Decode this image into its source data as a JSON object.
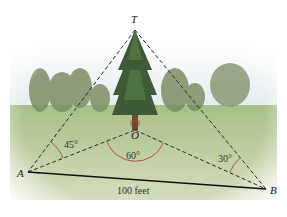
{
  "diagram": {
    "points": {
      "T": {
        "label": "T",
        "x": 135,
        "y": 30
      },
      "O": {
        "label": "O",
        "x": 135,
        "y": 130
      },
      "A": {
        "label": "A",
        "x": 28,
        "y": 172
      },
      "B": {
        "label": "B",
        "x": 266,
        "y": 189
      }
    },
    "angles": {
      "A": "45°",
      "O": "60°",
      "B": "30°"
    },
    "base_length": "100 feet",
    "colors": {
      "sky": "#e8eef0",
      "grass": "#b9c89a",
      "trees": "#6f8557",
      "pine": "#3f5a36",
      "dashed_line": "#2a2a2a",
      "solid_line": "#111111",
      "angle_arc": "#b04a3a"
    }
  }
}
